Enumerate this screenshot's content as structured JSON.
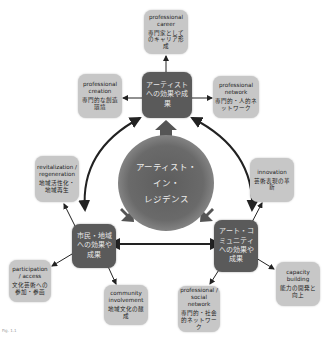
{
  "diagram": {
    "center": {
      "label_lines": [
        "アーティスト・",
        "イン・",
        "レジデンス"
      ]
    },
    "hubs": [
      {
        "id": "artist",
        "label": "アーティストへの効果や成果"
      },
      {
        "id": "citizen",
        "label": "市民・地域への効果や成果"
      },
      {
        "id": "art_community",
        "label": "アート・コミュニティへの効果や成果"
      }
    ],
    "outcomes": [
      {
        "id": "career",
        "en": "professional career",
        "jp": "専門家としてのキャリア形成",
        "hub": "artist"
      },
      {
        "id": "creation",
        "en": "professional creation",
        "jp": "専門的な創造環境",
        "hub": "artist"
      },
      {
        "id": "network",
        "en": "professional network",
        "jp": "専門的・人的ネットワーク",
        "hub": "artist"
      },
      {
        "id": "revitalization",
        "en": "revitalization / regeneration",
        "jp": "地域活性化・地域再生",
        "hub": "citizen"
      },
      {
        "id": "participation",
        "en": "participation / access",
        "jp": "文化芸術への参加・参画",
        "hub": "citizen"
      },
      {
        "id": "community",
        "en": "community involvement",
        "jp": "地域文化の醸成",
        "hub": "citizen"
      },
      {
        "id": "innovation",
        "en": "innovation",
        "jp": "芸術表現の革新",
        "hub": "art_community"
      },
      {
        "id": "capacity",
        "en": "capacity building",
        "jp": "能力の開発と向上",
        "hub": "art_community"
      },
      {
        "id": "social_network",
        "en": "professional / social network",
        "jp": "専門的・社会的ネットワーク",
        "hub": "art_community"
      }
    ],
    "caption": "Fig. 1.1"
  },
  "colors": {
    "hub": "#5a5a5a",
    "box": "#c7c7c7",
    "arrow": "#222222",
    "center": "#666666"
  }
}
